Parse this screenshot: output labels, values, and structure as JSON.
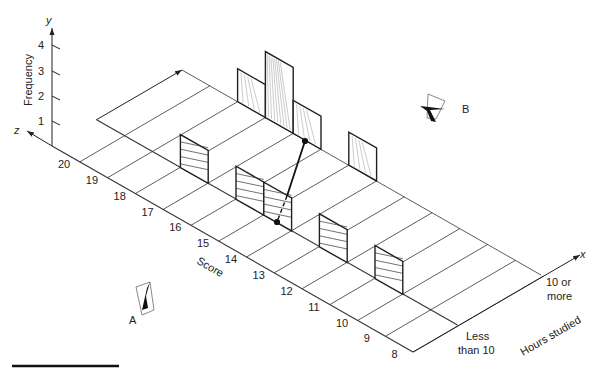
{
  "figure": {
    "axes": {
      "x_letter": "x",
      "y_letter": "y",
      "z_letter": "z",
      "y_label": "Frequency",
      "y_ticks": [
        "1",
        "2",
        "3",
        "4"
      ],
      "score_label": "Score",
      "score_ticks": [
        "20",
        "19",
        "18",
        "17",
        "16",
        "15",
        "14",
        "13",
        "12",
        "11",
        "10",
        "9",
        "8"
      ],
      "hours_label": "Hours studied",
      "hours_categories": [
        "Less than 10",
        "10 or more"
      ],
      "hours_cat_lines": {
        "less": [
          "Less",
          "than 10"
        ],
        "more": [
          "10 or",
          "more"
        ]
      }
    },
    "viewpoints": {
      "a": "A",
      "b": "B"
    }
  },
  "chart_data": {
    "type": "bar",
    "subtype": "3d-bar",
    "title": "",
    "xlabel": "Hours studied",
    "ylabel": "Frequency",
    "zlabel": "Score",
    "categories": [
      "20",
      "19",
      "18",
      "17",
      "16",
      "15",
      "14",
      "13",
      "12",
      "11",
      "10",
      "9",
      "8"
    ],
    "ylim": [
      0,
      4
    ],
    "grid": true,
    "series": [
      {
        "name": "Less than 10",
        "hatch": "horizontal",
        "values": [
          0,
          0,
          0,
          1,
          0,
          1,
          1,
          0,
          1,
          0,
          1,
          0,
          0
        ]
      },
      {
        "name": "10 or more",
        "hatch": "diagonal",
        "values": [
          0,
          0,
          1,
          2,
          1,
          0,
          1,
          0,
          0,
          0,
          0,
          0,
          0
        ]
      }
    ],
    "annotations": [
      "Viewpoint A",
      "Viewpoint B",
      "Line segment joining two points (partly hidden, dashed)"
    ]
  }
}
